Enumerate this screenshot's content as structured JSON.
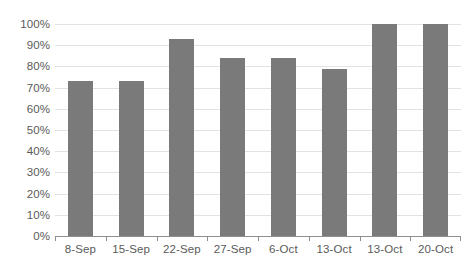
{
  "chart_data": {
    "type": "bar",
    "title": "",
    "subtitle": "",
    "xlabel": "",
    "ylabel": "",
    "categories": [
      "8-Sep",
      "15-Sep",
      "22-Sep",
      "27-Sep",
      "6-Oct",
      "13-Oct",
      "13-Oct",
      "20-Oct"
    ],
    "values": [
      73,
      73,
      93,
      84,
      84,
      79,
      100,
      100
    ],
    "ylim": [
      0,
      100
    ],
    "ytick_labels": [
      "0%",
      "10%",
      "20%",
      "30%",
      "40%",
      "50%",
      "60%",
      "70%",
      "80%",
      "90%",
      "100%"
    ],
    "ytick_values": [
      0,
      10,
      20,
      30,
      40,
      50,
      60,
      70,
      80,
      90,
      100
    ],
    "grid": "horizontal",
    "legend": "none",
    "series": [
      {
        "name": "",
        "values": [
          73,
          73,
          93,
          84,
          84,
          79,
          100,
          100
        ]
      }
    ],
    "colors": {
      "bar": "#7a7a7a",
      "gridline": "#e2e2e2",
      "axis": "#8f8f8f",
      "text": "#5a5a5a",
      "background": "#ffffff"
    }
  }
}
